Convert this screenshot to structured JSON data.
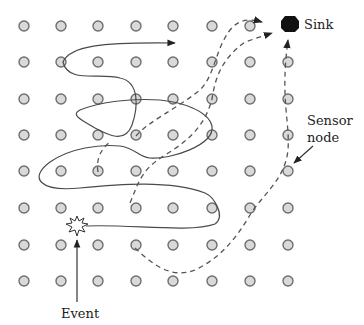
{
  "diagram": {
    "title": "",
    "grid": {
      "columns_x": [
        24,
        61,
        98,
        136,
        173,
        212,
        250,
        288
      ],
      "rows_y": [
        26,
        62,
        99,
        135,
        171,
        208,
        245,
        281
      ],
      "node_radius": 5
    },
    "labels": {
      "sink": "Sink",
      "sensor_line1": "Sensor",
      "sensor_line2": "node",
      "event": "Event"
    },
    "sink": {
      "x": 290,
      "y": 24,
      "r": 7
    },
    "event": {
      "x": 77,
      "y": 226
    },
    "legend_semantics": {
      "solid_path": "random walk",
      "dashed_path": "routes to sink"
    },
    "colors": {
      "node_fill": "#d9d9d9",
      "node_stroke": "#6e6e6e",
      "sink": "#111111",
      "path": "#4a4a4a"
    }
  }
}
